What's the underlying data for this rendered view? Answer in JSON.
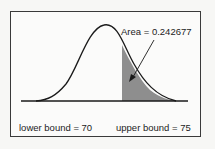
{
  "diagram": {
    "type": "normal-distribution-area",
    "area_label": "Area = 0.242677",
    "lower_label": "lower bound = 70",
    "upper_label": "upper bound = 75",
    "area_value": 0.242677,
    "lower_bound": 70,
    "upper_bound": 75,
    "colors": {
      "curve": "#1a1a1a",
      "shade": "#8e8e8e",
      "border": "#3a3a3a"
    }
  }
}
